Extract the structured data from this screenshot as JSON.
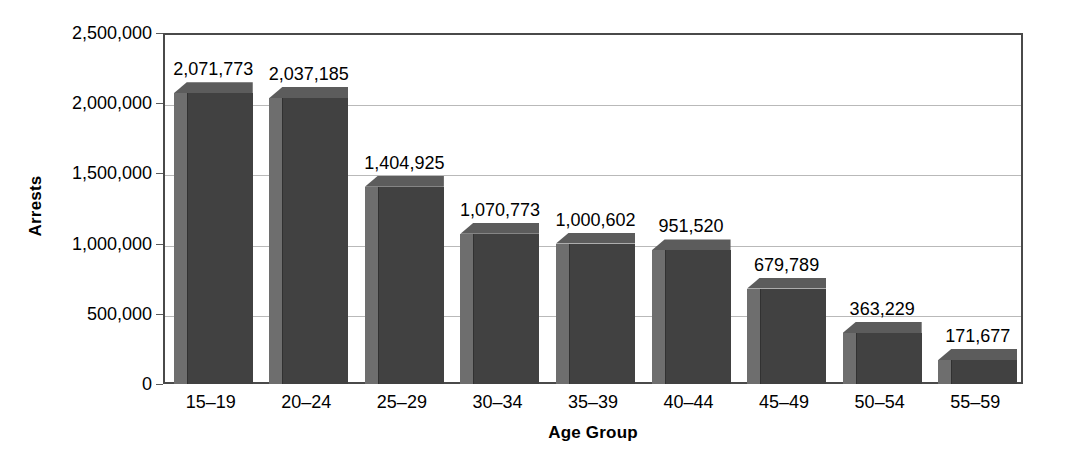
{
  "chart_data": {
    "type": "bar",
    "title": "",
    "xlabel": "Age Group",
    "ylabel": "Arrests",
    "categories": [
      "15–19",
      "20–24",
      "25–29",
      "30–34",
      "35–39",
      "40–44",
      "45–49",
      "50–54",
      "55–59"
    ],
    "values": [
      2071773,
      2037185,
      1404925,
      1070773,
      1000602,
      951520,
      679789,
      363229,
      171677
    ],
    "value_labels": [
      "2,071,773",
      "2,037,185",
      "1,404,925",
      "1,070,773",
      "1,000,602",
      "951,520",
      "679,789",
      "363,229",
      "171,677"
    ],
    "ylim": [
      0,
      2500000
    ],
    "ytick_values": [
      0,
      500000,
      1000000,
      1500000,
      2000000,
      2500000
    ],
    "ytick_labels": [
      "0",
      "500,000",
      "1,000,000",
      "1,500,000",
      "2,000,000",
      "2,500,000"
    ],
    "grid": "horizontal",
    "legend": "none",
    "style": "3d-column",
    "colors": {
      "bar_front": "#414141",
      "bar_side": "#6e6e6e",
      "bar_top": "#5c5c5c",
      "shadow": "#c3c3c3",
      "gridline": "#b9b9b9",
      "frame": "#4a4a4a",
      "background": "#ffffff",
      "text": "#000000"
    }
  }
}
